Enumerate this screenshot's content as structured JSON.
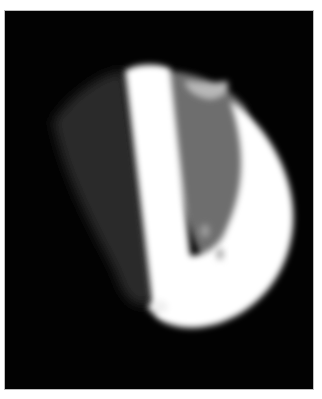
{
  "image": {
    "description": "Grayscale fluorescence-like image of a bright, roughly hemispherical object on black background",
    "background_color": "#020202",
    "border_color": "#bdbdbd",
    "page_color": "#ffffff",
    "frame": {
      "x": 4,
      "y": 10,
      "width": 310,
      "height": 380
    },
    "regions": [
      {
        "name": "bright-bar",
        "tone": "#ffffff"
      },
      {
        "name": "bright-crescent",
        "tone": "#ffffff"
      },
      {
        "name": "gray-interior",
        "tone": "#6a6a6a"
      },
      {
        "name": "faint-left-haze",
        "tone": "#2e2e2e"
      }
    ]
  }
}
